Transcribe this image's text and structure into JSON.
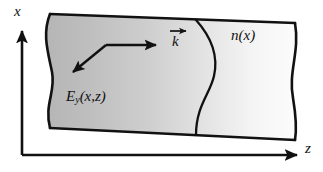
{
  "figure": {
    "type": "physics-schematic",
    "background_color": "#ffffff",
    "line_color": "#111111"
  },
  "axes": {
    "vertical": {
      "name": "x-axis",
      "label": "x",
      "arrow_direction": "up",
      "origin_px": [
        22,
        155
      ],
      "tip_px": [
        22,
        28
      ]
    },
    "horizontal": {
      "name": "z-axis",
      "label": "z",
      "arrow_direction": "right",
      "origin_px": [
        22,
        155
      ],
      "tip_px": [
        300,
        155
      ]
    }
  },
  "slab": {
    "name": "waveguide-slab",
    "description": "Shaded slab with torn wavy left and right edges",
    "fill_description": "horizontal gray gradient, dark at left, near white at right",
    "gradient_stops": [
      "#b9b9b9",
      "#c9c9c9",
      "#dedede",
      "#f2f2f2",
      "#fbfbfb"
    ],
    "edge_color": "#111111",
    "top_edge_px": [
      [
        50,
        14
      ],
      [
        295,
        23
      ]
    ],
    "bottom_edge_px": [
      [
        50,
        128
      ],
      [
        295,
        140
      ]
    ]
  },
  "index_profile": {
    "name": "refractive-index-curve",
    "label": "n(x)",
    "label_italic": true,
    "description": "S-shaped curve inside the slab representing the graded index profile n(x)"
  },
  "field_label": {
    "name": "field-label",
    "symbol": "E",
    "subscript": "y",
    "arguments": "(x,z)",
    "full": "Ey(x,z)"
  },
  "wavevector": {
    "name": "wavevector-label",
    "symbol": "k",
    "has_vector_arrow": true,
    "full": "k",
    "ray": {
      "description": "bent ray: incoming down-left arrow and outgoing right arrow meeting at a vertex",
      "vertex_px": [
        106,
        45
      ],
      "right_arrow_tip_px": [
        158,
        45
      ],
      "left_arrow_tip_px": [
        70,
        75
      ]
    }
  },
  "labels": {
    "x_axis": "x",
    "z_axis": "z",
    "index": "n(x)",
    "index_n": "n",
    "index_arg": "(x)",
    "field_E": "E",
    "field_sub": "y",
    "field_arg": "(x,z)",
    "k": "k"
  }
}
